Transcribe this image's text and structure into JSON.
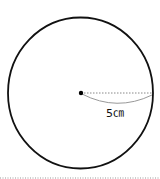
{
  "figure": {
    "shape": "circle",
    "radius_label": "5㎝",
    "radius_value": 5,
    "radius_unit": "cm",
    "colors": {
      "outline": "#111111",
      "radius_line": "#888888",
      "arc": "#999999",
      "separator": "#999999"
    }
  }
}
